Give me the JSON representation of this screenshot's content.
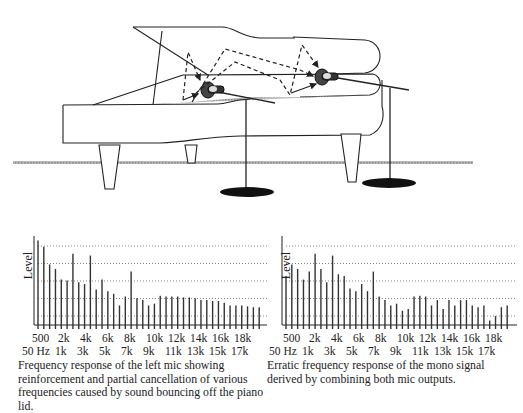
{
  "illustration": {
    "subject": "grand piano with lid open and two microphones on stands",
    "elements": [
      "piano-lid",
      "piano-body",
      "piano-legs",
      "left-mic",
      "right-mic",
      "sound-reflection-paths",
      "floor-line",
      "mic-stand-bases"
    ]
  },
  "charts": {
    "left": {
      "ylabel": "Level",
      "upper_ticks": [
        "500",
        "2k",
        "4k",
        "6k",
        "8k",
        "10k",
        "12k",
        "14k",
        "16k",
        "18k"
      ],
      "lower_ticks": [
        "50 Hz",
        "1k",
        "3k",
        "5k",
        "7k",
        "9k",
        "11k",
        "13k",
        "15k",
        "17k"
      ],
      "caption": "Frequency response of the left mic showing reinforcement and partial cancellation of various frequencies caused by sound bouncing off the piano lid."
    },
    "right": {
      "ylabel": "Level",
      "upper_ticks": [
        "500",
        "2k",
        "4k",
        "6k",
        "8k",
        "10k",
        "12k",
        "14k",
        "16k",
        "18k"
      ],
      "lower_ticks": [
        "50 Hz",
        "1k",
        "3k",
        "5k",
        "7k",
        "9k",
        "11k",
        "13k",
        "15k",
        "17k"
      ],
      "caption": "Erratic frequency response of the mono signal derived by combining both mic outputs."
    }
  },
  "chart_data": [
    {
      "type": "bar",
      "title": "Left mic frequency response",
      "xlabel": "Frequency",
      "ylabel": "Level",
      "x_range": [
        "50 Hz",
        "18k"
      ],
      "grid": "horizontal dotted, 5 lines",
      "values": [
        95,
        88,
        68,
        63,
        51,
        50,
        80,
        48,
        46,
        78,
        40,
        51,
        38,
        35,
        22,
        32,
        60,
        30,
        28,
        22,
        24,
        33,
        32,
        32,
        32,
        31,
        31,
        30,
        28,
        28,
        27,
        27,
        25,
        22,
        22,
        22,
        21,
        20,
        20
      ]
    },
    {
      "type": "bar",
      "title": "Mono signal frequency response",
      "xlabel": "Frequency",
      "ylabel": "Level",
      "x_range": [
        "50 Hz",
        "18k"
      ],
      "grid": "horizontal dotted, 5 lines",
      "values": [
        55,
        68,
        63,
        51,
        60,
        80,
        63,
        48,
        78,
        57,
        55,
        41,
        38,
        46,
        38,
        60,
        32,
        28,
        22,
        24,
        16,
        18,
        32,
        33,
        32,
        22,
        28,
        18,
        28,
        22,
        28,
        28,
        22,
        20,
        22,
        5,
        10,
        20,
        22
      ]
    }
  ]
}
